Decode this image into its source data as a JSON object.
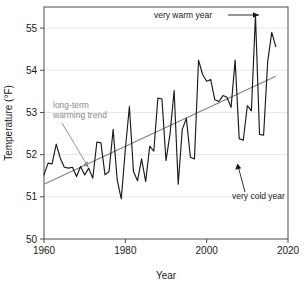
{
  "chart_data": {
    "type": "line",
    "title": "",
    "xlabel": "Year",
    "ylabel": "Temperature (°F)",
    "xlim": [
      1960,
      2020
    ],
    "ylim": [
      50,
      55.5
    ],
    "xticks": [
      "1960",
      "1980",
      "2000",
      "2020"
    ],
    "xtick_values": [
      1960,
      1980,
      2000,
      2020
    ],
    "yticks": [
      "50",
      "51",
      "52",
      "53",
      "54",
      "55"
    ],
    "ytick_values": [
      50,
      51,
      52,
      53,
      54,
      55
    ],
    "grid": true,
    "legend": "none",
    "series": [
      {
        "name": "Annual average temperature",
        "color": "#1a1a1a",
        "x": [
          1960,
          1961,
          1962,
          1963,
          1964,
          1965,
          1966,
          1967,
          1968,
          1969,
          1970,
          1971,
          1972,
          1973,
          1974,
          1975,
          1976,
          1977,
          1978,
          1979,
          1980,
          1981,
          1982,
          1983,
          1984,
          1985,
          1986,
          1987,
          1988,
          1989,
          1990,
          1991,
          1992,
          1993,
          1994,
          1995,
          1996,
          1997,
          1998,
          1999,
          2000,
          2001,
          2002,
          2003,
          2004,
          2005,
          2006,
          2007,
          2008,
          2009,
          2010,
          2011,
          2012,
          2013,
          2014,
          2015,
          2016,
          2017
        ],
        "values": [
          51.52,
          51.8,
          51.78,
          52.25,
          51.92,
          51.7,
          51.68,
          51.7,
          51.48,
          51.72,
          51.52,
          51.68,
          51.44,
          52.3,
          52.28,
          51.52,
          51.6,
          52.6,
          51.4,
          50.95,
          52.12,
          53.14,
          51.6,
          51.38,
          51.9,
          51.36,
          52.2,
          52.08,
          53.34,
          53.32,
          51.86,
          52.5,
          53.52,
          51.3,
          52.6,
          52.86,
          51.94,
          51.9,
          54.24,
          53.9,
          53.74,
          53.78,
          53.3,
          53.26,
          53.4,
          53.36,
          53.12,
          54.24,
          52.38,
          52.34,
          53.16,
          53.04,
          55.3,
          52.48,
          52.46,
          54.2,
          54.9,
          54.56
        ]
      },
      {
        "name": "long-term warming trend",
        "color": "#808080",
        "type": "trendline",
        "x": [
          1960,
          2017
        ],
        "values": [
          51.3,
          53.86
        ]
      }
    ],
    "annotations": [
      {
        "id": "very-warm-year",
        "text": "very warm year",
        "text_color": "#1a1a1a",
        "arrow": "right",
        "points_to_year": 2012,
        "points_to_value": 55.3
      },
      {
        "id": "very-cold-year",
        "text": "very cold year",
        "text_color": "#1a1a1a",
        "arrow": "up-left",
        "points_to_year": 2009,
        "points_to_value": 52.34
      },
      {
        "id": "long-term-warming-trend",
        "text_line1": "long-term",
        "text_line2": "warming trend",
        "text_color": "#8a8a8a",
        "arrow": "down-right",
        "points_to_year": 1972,
        "points_to_value": 51.78
      }
    ]
  },
  "colors": {
    "series_line": "#1a1a1a",
    "trend_line": "#808080",
    "grid": "#e8e8e8",
    "axis": "#4d4d4d",
    "annotation_gray": "#8a8a8a",
    "annotation_dark": "#1a1a1a",
    "background": "#ffffff"
  }
}
